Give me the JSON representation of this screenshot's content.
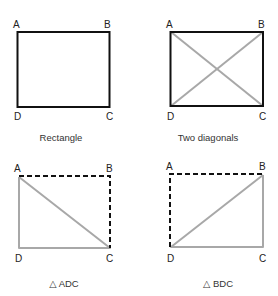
{
  "colors": {
    "solid_edge": "#111111",
    "gray_edge": "#a8a8a8",
    "dashed_edge": "#111111",
    "text": "#222222"
  },
  "panels": [
    {
      "id": "rectangle",
      "caption": "Rectangle",
      "vertices": {
        "A": "A",
        "B": "B",
        "C": "C",
        "D": "D"
      },
      "description": "Rectangle ABCD drawn with solid black edges"
    },
    {
      "id": "two-diagonals",
      "caption": "Two diagonals",
      "vertices": {
        "A": "A",
        "B": "B",
        "C": "C",
        "D": "D"
      },
      "description": "Rectangle ABCD with gray diagonals AC and BD"
    },
    {
      "id": "triangle-adc",
      "caption": "△ ADC",
      "vertices": {
        "A": "A",
        "B": "B",
        "C": "C",
        "D": "D"
      },
      "description": "Triangle ADC in gray; AB and BC dashed"
    },
    {
      "id": "triangle-bdc",
      "caption": "△ BDC",
      "vertices": {
        "A": "A",
        "B": "B",
        "C": "C",
        "D": "D"
      },
      "description": "Triangle BDC in gray; AD and AB dashed"
    }
  ]
}
